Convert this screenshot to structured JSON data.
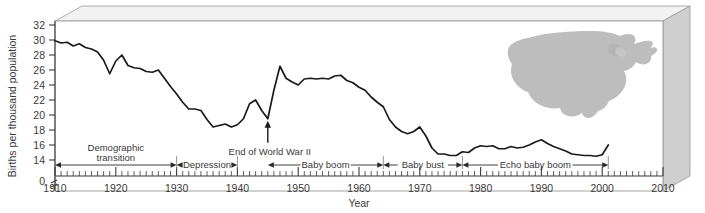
{
  "figure": {
    "background": "#ffffff",
    "line_color": "#1a1a1a",
    "frame_color": "#9a9a9a",
    "panel_side_color": "#c9c9c9",
    "panel_top_color": "#efefef",
    "map_color": "#bcbcbc",
    "map_name": "united-states-silhouette"
  },
  "chart_data": {
    "type": "line",
    "title": "",
    "xlabel": "Year",
    "ylabel": "Births per thousand population",
    "xlim": [
      1910,
      2010
    ],
    "ylim": [
      13,
      32
    ],
    "y_axis_break": true,
    "y_break_label": "0",
    "grid": false,
    "legend": null,
    "xticks": [
      1910,
      1920,
      1930,
      1940,
      1950,
      1960,
      1970,
      1980,
      1990,
      2000,
      2010
    ],
    "xtick_minor_step": 1,
    "yticks": [
      14,
      16,
      18,
      20,
      22,
      24,
      26,
      28,
      30,
      32
    ],
    "series": [
      {
        "name": "US birth rate",
        "x": [
          1910,
          1911,
          1912,
          1913,
          1914,
          1915,
          1916,
          1917,
          1918,
          1919,
          1920,
          1921,
          1922,
          1923,
          1924,
          1925,
          1926,
          1927,
          1928,
          1929,
          1930,
          1931,
          1932,
          1933,
          1934,
          1935,
          1936,
          1937,
          1938,
          1939,
          1940,
          1941,
          1942,
          1943,
          1944,
          1945,
          1946,
          1947,
          1948,
          1949,
          1950,
          1951,
          1952,
          1953,
          1954,
          1955,
          1956,
          1957,
          1958,
          1959,
          1960,
          1961,
          1962,
          1963,
          1964,
          1965,
          1966,
          1967,
          1968,
          1969,
          1970,
          1971,
          1972,
          1973,
          1974,
          1975,
          1976,
          1977,
          1978,
          1979,
          1980,
          1981,
          1982,
          1983,
          1984,
          1985,
          1986,
          1987,
          1988,
          1989,
          1990,
          1991,
          1992,
          1993,
          1994,
          1995,
          1996,
          1997,
          1998,
          1999,
          2000,
          2001
        ],
        "values": [
          29.9,
          29.6,
          29.7,
          29.2,
          29.5,
          29.0,
          28.8,
          28.4,
          27.3,
          25.5,
          27.2,
          28.0,
          26.6,
          26.3,
          26.2,
          25.8,
          25.7,
          26.0,
          24.9,
          23.8,
          22.8,
          21.7,
          20.8,
          20.8,
          20.6,
          19.4,
          18.4,
          18.6,
          18.8,
          18.4,
          18.7,
          19.5,
          21.5,
          22.0,
          20.6,
          19.5,
          23.3,
          26.5,
          24.9,
          24.4,
          24.0,
          24.8,
          24.9,
          24.8,
          24.9,
          24.8,
          25.2,
          25.3,
          24.6,
          24.3,
          23.7,
          23.3,
          22.4,
          21.7,
          21.1,
          19.4,
          18.4,
          17.8,
          17.5,
          17.8,
          18.4,
          17.2,
          15.6,
          14.8,
          14.8,
          14.6,
          14.6,
          15.1,
          15.0,
          15.6,
          15.9,
          15.8,
          15.9,
          15.5,
          15.5,
          15.8,
          15.6,
          15.7,
          16.0,
          16.4,
          16.7,
          16.2,
          15.8,
          15.5,
          15.2,
          14.8,
          14.7,
          14.6,
          14.6,
          14.5,
          14.7,
          16.0
        ],
        "color": "#1a1a1a"
      }
    ],
    "annotations": [
      {
        "id": "end-of-wwii",
        "text": "End of World War II",
        "x": 1945,
        "y": 19.5,
        "arrow": "up"
      }
    ],
    "span_labels": [
      {
        "id": "demographic-transition",
        "text": "Demographic transition",
        "from": 1910,
        "to": 1930,
        "two_line": true
      },
      {
        "id": "depression",
        "text": "Depression",
        "from": 1930,
        "to": 1940,
        "two_line": false
      },
      {
        "id": "baby-boom",
        "text": "Baby boom",
        "from": 1945,
        "to": 1964,
        "two_line": false
      },
      {
        "id": "baby-bust",
        "text": "Baby bust",
        "from": 1964,
        "to": 1977,
        "two_line": false
      },
      {
        "id": "echo-baby-boom",
        "text": "Echo baby boom",
        "from": 1977,
        "to": 2001,
        "two_line": false
      }
    ]
  }
}
